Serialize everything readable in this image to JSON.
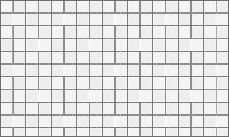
{
  "figure": {
    "kind": "tiling-pattern-texture",
    "width": 229,
    "height": 137,
    "background_color": "#fbfbfb"
  },
  "colors": {
    "tile_fill": "#f4f4f4",
    "tile_fill_alt": "#eeeeee",
    "grout_line": "#8c8c8c",
    "grid_line": "#6e6e6e",
    "border": "#6e6e6e",
    "canvas_background": "#fbfbfb",
    "noise_tint": "#e8e8e8"
  },
  "geometry": {
    "block_size": 25.4,
    "columns": 9,
    "rows": 5.4,
    "tile_aspect_ratio": "2:1",
    "grout_width": 1.6,
    "grid_stroke_width": 0.9,
    "border_stroke_width": 1.0,
    "origin_x": 0.5,
    "origin_y": 0.5,
    "pinwheel_arms": 4,
    "alternation": "checkerboard-mirror"
  },
  "chart_data": {
    "type": "heatmap",
    "xlabel": "",
    "ylabel": "",
    "grid": true,
    "legend": "none",
    "xlim": [
      0,
      229
    ],
    "ylim": [
      0,
      137
    ],
    "categories": [
      "block-col-0",
      "block-col-1",
      "block-col-2",
      "block-col-3",
      "block-col-4",
      "block-col-5",
      "block-col-6",
      "block-col-7",
      "block-col-8"
    ],
    "values": [
      25.4,
      25.4,
      25.4,
      25.4,
      25.4,
      25.4,
      25.4,
      25.4,
      25.4
    ],
    "series": [
      {
        "name": "block-row-0",
        "values": [
          1,
          0,
          1,
          0,
          1,
          0,
          1,
          0,
          1
        ]
      },
      {
        "name": "block-row-1",
        "values": [
          0,
          1,
          0,
          1,
          0,
          1,
          0,
          1,
          0
        ]
      },
      {
        "name": "block-row-2",
        "values": [
          1,
          0,
          1,
          0,
          1,
          0,
          1,
          0,
          1
        ]
      },
      {
        "name": "block-row-3",
        "values": [
          0,
          1,
          0,
          1,
          0,
          1,
          0,
          1,
          0
        ]
      },
      {
        "name": "block-row-4",
        "values": [
          1,
          0,
          1,
          0,
          1,
          0,
          1,
          0,
          1
        ]
      },
      {
        "name": "block-row-5",
        "values": [
          0,
          1,
          0,
          1,
          0,
          1,
          0,
          1,
          0
        ]
      }
    ]
  }
}
